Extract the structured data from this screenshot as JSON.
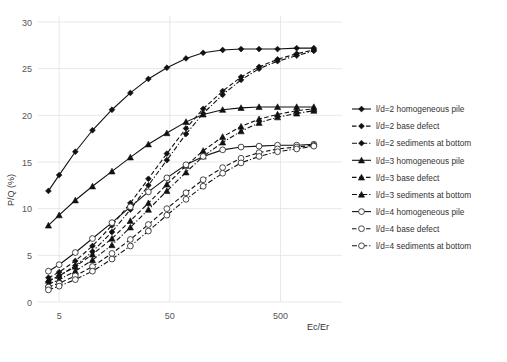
{
  "chart_data": {
    "type": "line",
    "title": "",
    "xlabel": "Ec/Er",
    "ylabel": "P/Q (%)",
    "xscale": "log",
    "xlim": [
      3.5,
      1400
    ],
    "ylim": [
      0,
      30
    ],
    "yticks": [
      0,
      5,
      10,
      15,
      20,
      25,
      30
    ],
    "xticks": [
      5,
      50,
      500
    ],
    "xticklabels": [
      "5",
      "50",
      "500"
    ],
    "grid": "both-faint",
    "legend_position": "right",
    "x": [
      4,
      5,
      7,
      10,
      15,
      22,
      32,
      47,
      70,
      100,
      150,
      220,
      320,
      470,
      700,
      1000
    ],
    "series": [
      {
        "name": "l/d=2 homogeneous pile",
        "marker": "diamond-filled",
        "linestyle": "solid",
        "values": [
          11.9,
          13.6,
          16.1,
          18.4,
          20.6,
          22.4,
          23.9,
          25.1,
          26.1,
          26.7,
          27.0,
          27.1,
          27.1,
          27.1,
          27.2,
          27.2
        ]
      },
      {
        "name": "l/d=2 base defect",
        "marker": "diamond-filled",
        "linestyle": "dashed",
        "values": [
          2.6,
          3.2,
          4.4,
          6.0,
          8.2,
          10.6,
          13.2,
          15.9,
          18.6,
          20.7,
          22.6,
          24.1,
          25.2,
          26.0,
          26.6,
          27.0
        ]
      },
      {
        "name": "l/d=2 sediments at bottom",
        "marker": "diamond-filled",
        "linestyle": "dash-dot",
        "values": [
          2.2,
          2.8,
          3.9,
          5.4,
          7.5,
          9.9,
          12.5,
          15.2,
          18.0,
          20.2,
          22.2,
          23.8,
          25.0,
          25.8,
          26.4,
          26.9
        ]
      },
      {
        "name": "l/d=3 homogeneous pile",
        "marker": "triangle-filled",
        "linestyle": "solid",
        "values": [
          8.2,
          9.3,
          10.9,
          12.4,
          14.0,
          15.5,
          16.9,
          18.1,
          19.3,
          20.1,
          20.6,
          20.8,
          20.9,
          20.9,
          20.9,
          20.9
        ]
      },
      {
        "name": "l/d=3 base defect",
        "marker": "triangle-filled",
        "linestyle": "dashed",
        "values": [
          2.3,
          2.8,
          3.8,
          5.1,
          6.8,
          8.7,
          10.6,
          12.6,
          14.6,
          16.2,
          17.7,
          18.8,
          19.6,
          20.1,
          20.5,
          20.7
        ]
      },
      {
        "name": "l/d=3 sediments at bottom",
        "marker": "triangle-filled",
        "linestyle": "dash-dot",
        "values": [
          1.9,
          2.4,
          3.3,
          4.5,
          6.1,
          8.0,
          9.9,
          11.9,
          13.9,
          15.6,
          17.1,
          18.3,
          19.2,
          19.8,
          20.2,
          20.5
        ]
      },
      {
        "name": "l/d=4  homogeneous pile",
        "marker": "circle-open",
        "linestyle": "solid",
        "values": [
          3.3,
          4.0,
          5.3,
          6.8,
          8.5,
          10.2,
          11.8,
          13.3,
          14.7,
          15.6,
          16.3,
          16.6,
          16.7,
          16.8,
          16.8,
          16.9
        ]
      },
      {
        "name": "l/d=4 base defect",
        "marker": "circle-open",
        "linestyle": "dashed",
        "values": [
          1.6,
          2.0,
          2.8,
          3.8,
          5.2,
          6.7,
          8.3,
          10.0,
          11.7,
          13.1,
          14.4,
          15.4,
          16.0,
          16.4,
          16.6,
          16.8
        ]
      },
      {
        "name": "l/d=4 sediments at bottom",
        "marker": "circle-open",
        "linestyle": "dash-dot",
        "values": [
          1.3,
          1.7,
          2.4,
          3.3,
          4.6,
          6.0,
          7.6,
          9.3,
          11.0,
          12.4,
          13.8,
          14.9,
          15.6,
          16.1,
          16.4,
          16.7
        ]
      }
    ]
  },
  "axes": {
    "ylabel": "P/Q (%)",
    "xlabel": "Ec/Er",
    "ytick_labels": [
      "0",
      "5",
      "10",
      "15",
      "20",
      "25",
      "30"
    ],
    "xtick_labels": [
      "5",
      "50",
      "500"
    ]
  },
  "legend": {
    "items": [
      {
        "label": "l/d=2 homogeneous pile",
        "marker": "diamond-filled",
        "style": "solid"
      },
      {
        "label": "l/d=2 base defect",
        "marker": "diamond-filled",
        "style": "dashed"
      },
      {
        "label": "l/d=2 sediments at bottom",
        "marker": "diamond-filled",
        "style": "dash-dot"
      },
      {
        "label": "l/d=3 homogeneous pile",
        "marker": "triangle-filled",
        "style": "solid"
      },
      {
        "label": "l/d=3 base defect",
        "marker": "triangle-filled",
        "style": "dashed"
      },
      {
        "label": "l/d=3 sediments at bottom",
        "marker": "triangle-filled",
        "style": "dash-dot"
      },
      {
        "label": "l/d=4  homogeneous pile",
        "marker": "circle-open",
        "style": "solid"
      },
      {
        "label": "l/d=4 base defect",
        "marker": "circle-open",
        "style": "dashed"
      },
      {
        "label": "l/d=4 sediments at bottom",
        "marker": "circle-open",
        "style": "dash-dot"
      }
    ]
  },
  "colors": {
    "line": "#111111",
    "grid": "#e2e2e2",
    "text": "#3a3a3a"
  }
}
